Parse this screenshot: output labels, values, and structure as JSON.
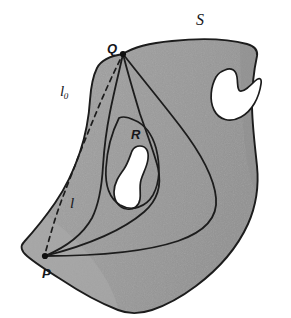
{
  "figure": {
    "kind": "mathematical-diagram",
    "canvas": {
      "width": 291,
      "height": 318,
      "background": "#ffffff"
    },
    "colors": {
      "background": "#ffffff",
      "surface_fill": "#9b9b9b",
      "surface_fill_light": "#a8a8a8",
      "surface_fill_shadow": "#8e8e8e",
      "hole_fill": "#ffffff",
      "outline": "#1c1c1c",
      "curve": "#1c1c1c",
      "dashed_curve": "#1c1c1c",
      "label": "#16161a"
    },
    "labels": [
      {
        "id": "S",
        "text": "S",
        "role": "surface-name",
        "x": 196,
        "y": 12,
        "style": "italic-serif"
      },
      {
        "id": "Q",
        "text": "Q",
        "role": "point-name",
        "x": 107,
        "y": 42,
        "style": "italic-sans"
      },
      {
        "id": "l0",
        "text": "l",
        "subscript": "0",
        "role": "curve-name",
        "x": 60,
        "y": 84,
        "style": "script"
      },
      {
        "id": "R",
        "text": "R",
        "role": "region-name",
        "x": 131,
        "y": 128,
        "style": "italic-sans"
      },
      {
        "id": "l",
        "text": "l",
        "subscript": "",
        "role": "curve-name",
        "x": 70,
        "y": 196,
        "style": "script"
      },
      {
        "id": "P",
        "text": "P",
        "role": "point-name",
        "x": 42,
        "y": 267,
        "style": "italic-sans"
      }
    ],
    "points": [
      {
        "id": "Q",
        "label": "Q",
        "x": 123,
        "y": 54
      },
      {
        "id": "P",
        "label": "P",
        "x": 45,
        "y": 256
      }
    ],
    "curves": [
      {
        "id": "geodesic-1",
        "from": "Q",
        "to": "P",
        "style": "solid",
        "note": "leftmost geodesic hugging the left boundary"
      },
      {
        "id": "geodesic-2",
        "from": "Q",
        "to": "P",
        "style": "solid",
        "note": "middle geodesic passing left of region R"
      },
      {
        "id": "geodesic-3",
        "from": "Q",
        "to": "P",
        "style": "solid",
        "note": "long geodesic sweeping right across the surface"
      },
      {
        "id": "l0-dashed",
        "from": "Q",
        "to": "P",
        "style": "dashed",
        "note": "reference curve l-zero outside the surface"
      }
    ],
    "holes": [
      {
        "id": "hole-upper-right",
        "shape": "crescent",
        "cx": 238,
        "cy": 92
      },
      {
        "id": "hole-R",
        "shape": "elongated-blob",
        "cx": 134,
        "cy": 172,
        "belongs_to": "R"
      }
    ]
  }
}
